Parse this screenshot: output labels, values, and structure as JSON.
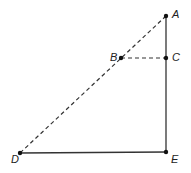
{
  "diagram": {
    "colors": {
      "line": "#333333",
      "point": "#111111",
      "background": "#ffffff"
    },
    "points": [
      {
        "id": "A",
        "label": "A",
        "x": 166,
        "y": 16,
        "lx": 172,
        "ly": 18
      },
      {
        "id": "B",
        "label": "B",
        "x": 121,
        "y": 58,
        "lx": 110,
        "ly": 61
      },
      {
        "id": "C",
        "label": "C",
        "x": 166,
        "y": 58,
        "lx": 172,
        "ly": 61
      },
      {
        "id": "D",
        "label": "D",
        "x": 20,
        "y": 153,
        "lx": 11,
        "ly": 163
      },
      {
        "id": "E",
        "label": "E",
        "x": 166,
        "y": 152,
        "lx": 171,
        "ly": 163
      }
    ],
    "segments": [
      {
        "from": "A",
        "to": "D",
        "style": "dashed"
      },
      {
        "from": "B",
        "to": "C",
        "style": "dashed"
      },
      {
        "from": "A",
        "to": "E",
        "style": "solid"
      },
      {
        "from": "D",
        "to": "E",
        "style": "solid"
      }
    ]
  }
}
